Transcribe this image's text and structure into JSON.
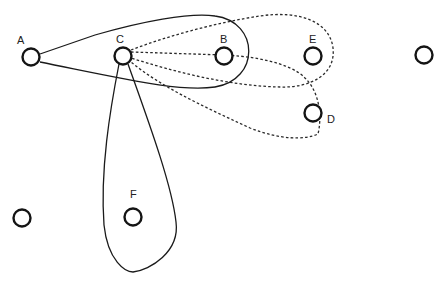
{
  "diagram": {
    "type": "graph-with-loops",
    "nodes": [
      {
        "id": "A",
        "label": "A",
        "x": 31,
        "y": 57
      },
      {
        "id": "C",
        "label": "C",
        "x": 123,
        "y": 56
      },
      {
        "id": "B",
        "label": "B",
        "x": 224,
        "y": 56
      },
      {
        "id": "E",
        "label": "E",
        "x": 313,
        "y": 56
      },
      {
        "id": "R",
        "label": "",
        "x": 424,
        "y": 55
      },
      {
        "id": "D",
        "label": "D",
        "x": 313,
        "y": 113
      },
      {
        "id": "L",
        "label": "",
        "x": 22,
        "y": 218
      },
      {
        "id": "F",
        "label": "F",
        "x": 133,
        "y": 217
      }
    ],
    "labels": {
      "A": "A",
      "C": "C",
      "B": "B",
      "E": "E",
      "D": "D",
      "F": "F"
    },
    "loops": [
      {
        "name": "A-loop-around-C-B",
        "style": "solid",
        "from": "A",
        "encloses": [
          "C",
          "B"
        ]
      },
      {
        "name": "C-loop-around-F",
        "style": "solid",
        "from": "C",
        "encloses": [
          "F"
        ]
      },
      {
        "name": "C-loop-to-B",
        "style": "dashed",
        "from": "C",
        "encloses": [
          "B"
        ]
      },
      {
        "name": "C-loop-around-E",
        "style": "dashed",
        "from": "C",
        "encloses": [
          "E"
        ]
      },
      {
        "name": "C-loop-around-D",
        "style": "dashed",
        "from": "C",
        "encloses": [
          "D"
        ]
      }
    ]
  }
}
